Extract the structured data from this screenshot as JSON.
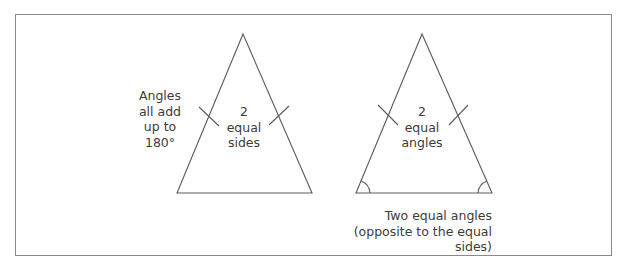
{
  "diagram": {
    "left_note": {
      "lines": [
        "Angles",
        "all add",
        "up to",
        "180°"
      ]
    },
    "triangle_1": {
      "label_lines": [
        "2",
        "equal",
        "sides"
      ]
    },
    "triangle_2": {
      "label_lines": [
        "2",
        "equal",
        "angles"
      ]
    },
    "caption": {
      "lines": [
        "Two equal angles",
        "(opposite to the equal sides)"
      ]
    },
    "colors": {
      "stroke": "#5a5a5a",
      "border": "#8a8a8a",
      "text": "#3c3c3c"
    }
  }
}
